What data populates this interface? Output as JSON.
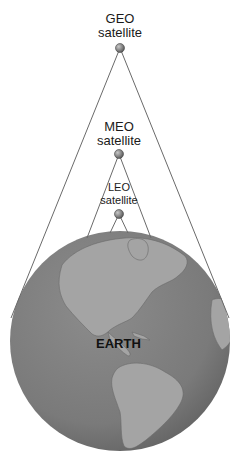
{
  "diagram": {
    "satellites": [
      {
        "name": "GEO",
        "label_line1": "GEO",
        "label_line2": "satellite",
        "x": 120,
        "y": 48
      },
      {
        "name": "MEO",
        "label_line1": "MEO",
        "label_line2": "satellite",
        "x": 119,
        "y": 154
      },
      {
        "name": "LEO",
        "label_line1": "LEO",
        "label_line2": "satellite",
        "x": 119,
        "y": 214
      }
    ],
    "earth": {
      "label": "EARTH",
      "cx": 120,
      "cy": 341,
      "r": 110
    },
    "colors": {
      "ocean": "#7d7d7d",
      "land": "#a6a6a6",
      "lines": "#6a6a6a",
      "satellite": "#8a8a8a",
      "text": "#1a1a1a"
    }
  }
}
